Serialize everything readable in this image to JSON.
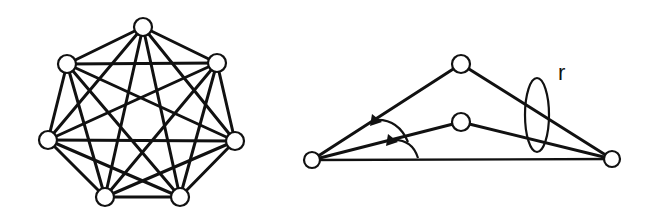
{
  "diagram": {
    "left_graph": {
      "name": "complete-graph-k7",
      "nodes": [
        {
          "id": 0,
          "x": 143,
          "y": 27
        },
        {
          "id": 1,
          "x": 217,
          "y": 63
        },
        {
          "id": 2,
          "x": 235,
          "y": 141
        },
        {
          "id": 3,
          "x": 180,
          "y": 197
        },
        {
          "id": 4,
          "x": 105,
          "y": 197
        },
        {
          "id": 5,
          "x": 48,
          "y": 140
        },
        {
          "id": 6,
          "x": 67,
          "y": 64
        }
      ],
      "edges": "all pairs (21 edges)"
    },
    "right_graph": {
      "nodes": [
        {
          "id": "left",
          "x": 312,
          "y": 160
        },
        {
          "id": "top",
          "x": 461,
          "y": 64
        },
        {
          "id": "middle",
          "x": 461,
          "y": 122
        },
        {
          "id": "right",
          "x": 612,
          "y": 159
        }
      ],
      "edges": [
        [
          "left",
          "top"
        ],
        [
          "top",
          "right"
        ],
        [
          "left",
          "middle"
        ],
        [
          "middle",
          "right"
        ],
        [
          "left",
          "right"
        ]
      ],
      "ellipse": {
        "cx": 537,
        "cy": 115,
        "rx": 12,
        "ry": 37
      },
      "label": "r"
    }
  }
}
